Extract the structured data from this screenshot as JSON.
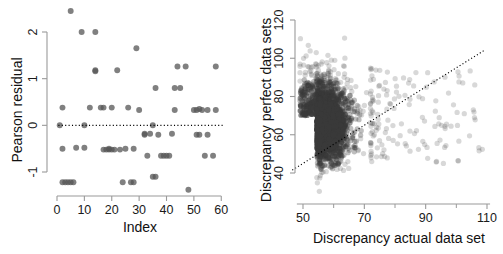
{
  "figure": {
    "background": "#ffffff",
    "panels": 2
  },
  "chart_data": [
    {
      "type": "scatter",
      "panel": "left",
      "title": "",
      "xlabel": "Index",
      "ylabel": "Pearson residual",
      "xlim": [
        0,
        61
      ],
      "ylim": [
        -1.45,
        2.55
      ],
      "xticks": [
        0,
        10,
        20,
        30,
        40,
        50,
        60
      ],
      "xticklabels": [
        "0",
        "10",
        "20",
        "30",
        "40",
        "50",
        "60"
      ],
      "yticks": [
        -1,
        0,
        1,
        2
      ],
      "yticklabels": [
        "-1",
        "0",
        "1",
        "2"
      ],
      "grid": false,
      "legend": false,
      "marker": {
        "shape": "circle",
        "color": "#555555",
        "opacity": 0.75,
        "size": 4.6
      },
      "annotations": [
        {
          "type": "hline",
          "y": 0,
          "style": "dotted",
          "color": "#000000"
        }
      ],
      "points": [
        {
          "x": 1,
          "y": 0.0
        },
        {
          "x": 2,
          "y": 0.38
        },
        {
          "x": 2,
          "y": -0.5
        },
        {
          "x": 2,
          "y": -1.22
        },
        {
          "x": 3,
          "y": -1.22
        },
        {
          "x": 4,
          "y": -1.22
        },
        {
          "x": 5,
          "y": -1.22
        },
        {
          "x": 5,
          "y": 2.45
        },
        {
          "x": 6,
          "y": -1.22
        },
        {
          "x": 7,
          "y": -0.48
        },
        {
          "x": 9,
          "y": 2.0
        },
        {
          "x": 10,
          "y": 0.0
        },
        {
          "x": 10,
          "y": -0.48
        },
        {
          "x": 12,
          "y": 0.38
        },
        {
          "x": 14,
          "y": 2.0
        },
        {
          "x": 14,
          "y": 1.18
        },
        {
          "x": 14,
          "y": 1.16
        },
        {
          "x": 16,
          "y": 0.38
        },
        {
          "x": 17,
          "y": -0.52
        },
        {
          "x": 17,
          "y": 0.38
        },
        {
          "x": 18,
          "y": -0.52
        },
        {
          "x": 19,
          "y": -0.52
        },
        {
          "x": 19,
          "y": -0.5
        },
        {
          "x": 20,
          "y": 0.38
        },
        {
          "x": 20,
          "y": -0.52
        },
        {
          "x": 21,
          "y": -0.52
        },
        {
          "x": 22,
          "y": 1.18
        },
        {
          "x": 23,
          "y": -0.52
        },
        {
          "x": 24,
          "y": -1.22
        },
        {
          "x": 25,
          "y": -0.5
        },
        {
          "x": 26,
          "y": 0.38
        },
        {
          "x": 27,
          "y": -1.22
        },
        {
          "x": 28,
          "y": -1.22
        },
        {
          "x": 28,
          "y": -0.5
        },
        {
          "x": 29,
          "y": 1.65
        },
        {
          "x": 30,
          "y": 0.33
        },
        {
          "x": 32,
          "y": -0.18
        },
        {
          "x": 32,
          "y": -0.2
        },
        {
          "x": 33,
          "y": -0.65
        },
        {
          "x": 34,
          "y": -0.18
        },
        {
          "x": 35,
          "y": 0.0
        },
        {
          "x": 35,
          "y": -1.1
        },
        {
          "x": 36,
          "y": -1.1
        },
        {
          "x": 36,
          "y": 0.8
        },
        {
          "x": 37,
          "y": -0.2
        },
        {
          "x": 38,
          "y": -0.65
        },
        {
          "x": 39,
          "y": -0.65
        },
        {
          "x": 40,
          "y": -0.65
        },
        {
          "x": 41,
          "y": -0.65
        },
        {
          "x": 42,
          "y": -0.18
        },
        {
          "x": 43,
          "y": 0.33
        },
        {
          "x": 43,
          "y": 0.8
        },
        {
          "x": 44,
          "y": 1.26
        },
        {
          "x": 45,
          "y": 0.8
        },
        {
          "x": 47,
          "y": 1.26
        },
        {
          "x": 48,
          "y": -1.38
        },
        {
          "x": 50,
          "y": 0.33
        },
        {
          "x": 51,
          "y": 0.33
        },
        {
          "x": 51,
          "y": -0.2
        },
        {
          "x": 52,
          "y": 0.35
        },
        {
          "x": 52,
          "y": -0.2
        },
        {
          "x": 53,
          "y": 0.33
        },
        {
          "x": 54,
          "y": -0.65
        },
        {
          "x": 55,
          "y": 0.33
        },
        {
          "x": 55,
          "y": -0.2
        },
        {
          "x": 57,
          "y": -0.65
        },
        {
          "x": 58,
          "y": 1.26
        },
        {
          "x": 58,
          "y": 0.33
        }
      ]
    },
    {
      "type": "scatter",
      "panel": "right",
      "title": "",
      "xlabel": "Discrepancy actual data set",
      "ylabel": "Discrepancy perfect data sets",
      "xlim": [
        43,
        113
      ],
      "ylim": [
        24,
        124
      ],
      "xticks": [
        50,
        70,
        90,
        110
      ],
      "xticklabels": [
        "50",
        "70",
        "90",
        "110"
      ],
      "xminorticks": [
        60,
        80,
        100
      ],
      "yticks": [
        40,
        60,
        80,
        100,
        120
      ],
      "yticklabels": [
        "40",
        "60",
        "80",
        "100",
        "120"
      ],
      "grid": false,
      "legend": false,
      "marker": {
        "shape": "circle",
        "color": "#3a3a3a",
        "opacity": 0.28,
        "size": 4.2
      },
      "annotations": [
        {
          "type": "line",
          "style": "dotted",
          "color": "#000000",
          "x0": 46.5,
          "y0": 41.5,
          "x1": 109,
          "y1": 104
        }
      ],
      "cloud": {
        "n_points": 2600,
        "core_x_range": [
          47,
          73
        ],
        "core_y_range": [
          42,
          96
        ],
        "core_center": [
          56,
          65
        ],
        "tail_x_range": [
          73,
          111
        ],
        "tail_y_range": [
          30,
          100
        ],
        "outlier_note": "sparse right tail extending to x=111, y-range 30-100"
      }
    }
  ]
}
